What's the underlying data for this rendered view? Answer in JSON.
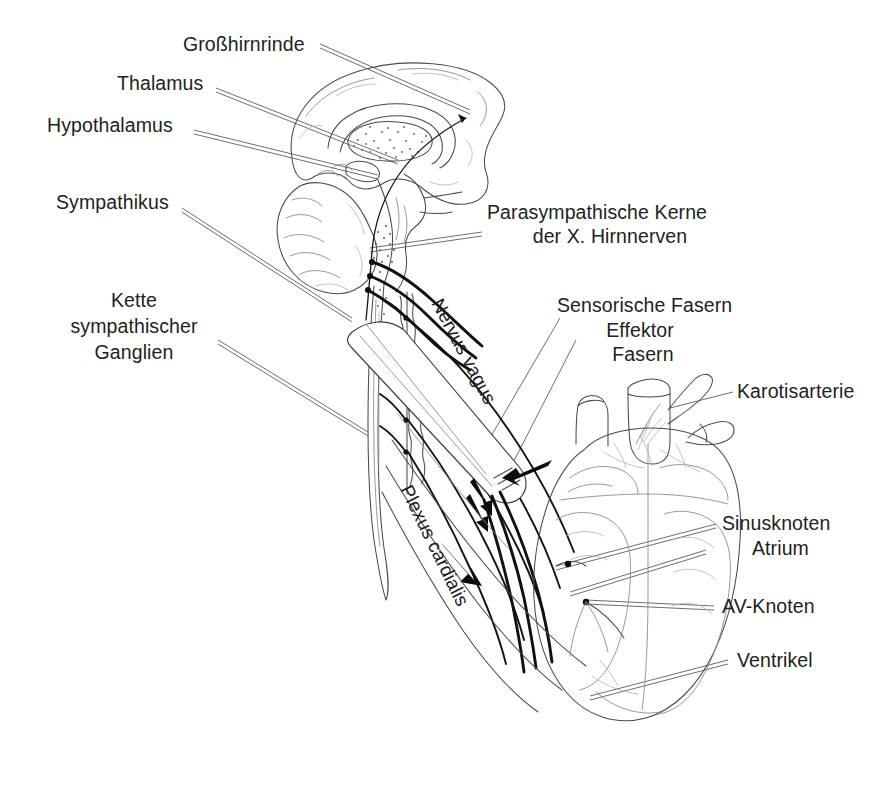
{
  "figure": {
    "background_color": "#ffffff",
    "ink_color": "#222222",
    "width": 883,
    "height": 789
  },
  "labels": {
    "grosshirnrinde": "Großhirnrinde",
    "thalamus": "Thalamus",
    "hypothalamus": "Hypothalamus",
    "sympathikus": "Sympathikus",
    "kette_line1": "Kette",
    "kette_line2": "sympathischer",
    "kette_line3": "Ganglien",
    "parasym_line1": "Parasympathische Kerne",
    "parasym_line2": "der X. Hirnnerven",
    "sensorische": "Sensorische Fasern",
    "effektor": "Effektor",
    "fasern": "Fasern",
    "karotisarterie": "Karotisarterie",
    "sinusknoten": "Sinusknoten",
    "atrium": "Atrium",
    "av_knoten": "AV-Knoten",
    "ventrikel": "Ventrikel",
    "nervus_vagus": "Nervus vagus",
    "plexus_cardialis": "Plexus cardialis"
  },
  "structures": [
    {
      "name": "cerebrum",
      "label": "Großhirnrinde"
    },
    {
      "name": "thalamus",
      "label": "Thalamus"
    },
    {
      "name": "hypothalamus",
      "label": "Hypothalamus"
    },
    {
      "name": "cerebellum",
      "label": "Kleinhirn"
    },
    {
      "name": "brainstem",
      "label": "Hirnstamm"
    },
    {
      "name": "spinal-cord",
      "label": "Rückenmark"
    },
    {
      "name": "sympathetic-chain",
      "label": "Kette sympathischer Ganglien"
    },
    {
      "name": "vagus-nerve",
      "label": "Nervus vagus"
    },
    {
      "name": "cardiac-plexus",
      "label": "Plexus cardialis"
    },
    {
      "name": "carotid-artery",
      "label": "Karotisarterie"
    },
    {
      "name": "heart",
      "label": "Herz"
    },
    {
      "name": "sinus-node",
      "label": "Sinusknoten"
    },
    {
      "name": "av-node",
      "label": "AV-Knoten"
    },
    {
      "name": "atrium",
      "label": "Atrium"
    },
    {
      "name": "ventricle",
      "label": "Ventrikel"
    }
  ]
}
